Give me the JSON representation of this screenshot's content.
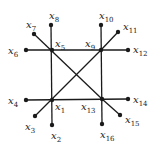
{
  "diagram": {
    "type": "graph",
    "nodes": [
      {
        "id": "x1",
        "label": "x",
        "sub": "1",
        "x": 52,
        "y": 100,
        "lx": 55,
        "ly": 110
      },
      {
        "id": "x2",
        "label": "x",
        "sub": "2",
        "x": 52,
        "y": 125,
        "lx": 51,
        "ly": 139
      },
      {
        "id": "x3",
        "label": "x",
        "sub": "3",
        "x": 35,
        "y": 116,
        "lx": 25,
        "ly": 130
      },
      {
        "id": "x4",
        "label": "x",
        "sub": "4",
        "x": 26,
        "y": 100,
        "lx": 8,
        "ly": 104
      },
      {
        "id": "x5",
        "label": "x",
        "sub": "5",
        "x": 52,
        "y": 50,
        "lx": 55,
        "ly": 47
      },
      {
        "id": "x6",
        "label": "x",
        "sub": "6",
        "x": 26,
        "y": 50,
        "lx": 8,
        "ly": 54
      },
      {
        "id": "x7",
        "label": "x",
        "sub": "7",
        "x": 34,
        "y": 34,
        "lx": 26,
        "ly": 28
      },
      {
        "id": "x8",
        "label": "x",
        "sub": "8",
        "x": 51,
        "y": 25,
        "lx": 49,
        "ly": 19
      },
      {
        "id": "x9",
        "label": "x",
        "sub": "9",
        "x": 101,
        "y": 50,
        "lx": 85,
        "ly": 47
      },
      {
        "id": "x10",
        "label": "x",
        "sub": "10",
        "x": 101,
        "y": 25,
        "lx": 99,
        "ly": 19
      },
      {
        "id": "x11",
        "label": "x",
        "sub": "11",
        "x": 118,
        "y": 32,
        "lx": 123,
        "ly": 30
      },
      {
        "id": "x12",
        "label": "x",
        "sub": "12",
        "x": 128,
        "y": 50,
        "lx": 133,
        "ly": 53
      },
      {
        "id": "x13",
        "label": "x",
        "sub": "13",
        "x": 102,
        "y": 99,
        "lx": 81,
        "ly": 110
      },
      {
        "id": "x14",
        "label": "x",
        "sub": "14",
        "x": 128,
        "y": 99,
        "lx": 133,
        "ly": 103
      },
      {
        "id": "x15",
        "label": "x",
        "sub": "15",
        "x": 120,
        "y": 115,
        "lx": 125,
        "ly": 123
      },
      {
        "id": "x16",
        "label": "x",
        "sub": "16",
        "x": 102,
        "y": 124,
        "lx": 100,
        "ly": 138
      }
    ],
    "edges": [
      [
        "x8",
        "x2"
      ],
      [
        "x10",
        "x16"
      ],
      [
        "x6",
        "x12"
      ],
      [
        "x4",
        "x14"
      ],
      [
        "x7",
        "x13"
      ],
      [
        "x3",
        "x9"
      ],
      [
        "x9",
        "x11"
      ],
      [
        "x13",
        "x15"
      ]
    ]
  }
}
